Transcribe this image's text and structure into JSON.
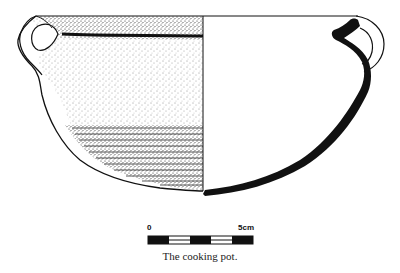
{
  "figure": {
    "subject": "cooking pot",
    "caption": "The cooking pot.",
    "left_half": "exterior view (stippled, with horizontal ribbing on lower body)",
    "right_half": "cross-section profile (solid black wall)",
    "handles": 2
  },
  "scale_bar": {
    "start_label": "0",
    "end_label": "5cm",
    "segments": 5,
    "colors": {
      "dark": "#111111",
      "light": "#ffffff"
    }
  },
  "colors": {
    "ink": "#111111",
    "background": "#ffffff"
  }
}
